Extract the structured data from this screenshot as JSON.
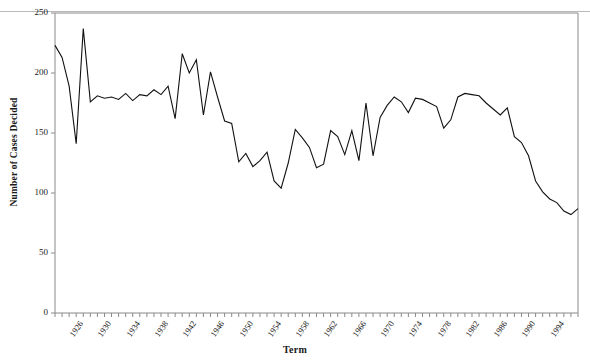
{
  "chart_data": {
    "type": "line",
    "title": "",
    "xlabel": "Term",
    "ylabel": "Number of Cases Decided",
    "xlim": [
      1926,
      2000
    ],
    "ylim": [
      0,
      250
    ],
    "ytick_labels": [
      "250",
      "200",
      "150",
      "100",
      "50",
      "0"
    ],
    "ytick_values": [
      250,
      200,
      150,
      100,
      50,
      0
    ],
    "xtick_labels": [
      "1926",
      "1930",
      "1934",
      "1938",
      "1942",
      "1946",
      "1950",
      "1954",
      "1958",
      "1962",
      "1966",
      "1970",
      "1974",
      "1978",
      "1982",
      "1986",
      "1990",
      "1994",
      "2000"
    ],
    "xtick_values": [
      1926,
      1930,
      1934,
      1938,
      1942,
      1946,
      1950,
      1954,
      1958,
      1962,
      1966,
      1970,
      1974,
      1978,
      1982,
      1986,
      1990,
      1994,
      2000
    ],
    "grid": false,
    "legend": false,
    "line_color": "#111111",
    "frame_color": "#8a8a8a",
    "x": [
      1926,
      1927,
      1928,
      1929,
      1930,
      1931,
      1932,
      1933,
      1934,
      1935,
      1936,
      1937,
      1938,
      1939,
      1940,
      1941,
      1942,
      1943,
      1944,
      1945,
      1946,
      1947,
      1948,
      1949,
      1950,
      1951,
      1952,
      1953,
      1954,
      1955,
      1956,
      1957,
      1958,
      1959,
      1960,
      1961,
      1962,
      1963,
      1964,
      1965,
      1966,
      1967,
      1968,
      1969,
      1970,
      1971,
      1972,
      1973,
      1974,
      1975,
      1976,
      1977,
      1978,
      1979,
      1980,
      1981,
      1982,
      1983,
      1984,
      1985,
      1986,
      1987,
      1988,
      1989,
      1990,
      1991,
      1992,
      1993,
      1994,
      1995,
      1996,
      1997,
      1998,
      1999,
      2000
    ],
    "values": [
      223,
      213,
      189,
      141,
      237,
      176,
      181,
      179,
      180,
      178,
      183,
      177,
      182,
      181,
      186,
      182,
      189,
      162,
      216,
      200,
      211,
      165,
      201,
      180,
      160,
      158,
      126,
      133,
      122,
      127,
      134,
      110,
      104,
      125,
      153,
      146,
      138,
      121,
      124,
      152,
      147,
      132,
      152,
      127,
      175,
      131,
      163,
      173,
      180,
      176,
      167,
      179,
      178,
      175,
      172,
      154,
      161,
      180,
      183,
      182,
      181,
      175,
      170,
      165,
      171,
      147,
      142,
      131,
      110,
      101,
      95,
      92,
      85,
      82,
      87
    ],
    "series_name": "Cases Decided"
  }
}
